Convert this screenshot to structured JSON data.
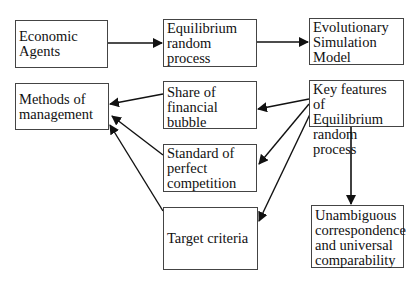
{
  "nodes": {
    "economic_agents": {
      "lines": [
        "Economic",
        "Agents"
      ]
    },
    "equilibrium_random_process": {
      "lines": [
        "Equilibrium",
        "random process"
      ]
    },
    "evolutionary_simulation_model": {
      "lines": [
        "Evolutionary",
        "Simulation",
        "Model"
      ]
    },
    "methods_of_management": {
      "line1a": "Methods",
      "line1b": "of",
      "line2": "management"
    },
    "share_of_financial_bubble": {
      "line1a": "Share",
      "line1b": "of",
      "line2": "financial bubble"
    },
    "key_features": {
      "line1a": "Key",
      "line1b": "features",
      "line1c": "of",
      "line2": "Equilibrium",
      "line3": "random process"
    },
    "standard_of_perfect_competition": {
      "line1a": "Standard",
      "line1b": "of",
      "line2": "perfect",
      "line3": "competition"
    },
    "target_criteria": {
      "lines": [
        "Target criteria"
      ]
    },
    "unambiguous_correspondence": {
      "line1": "Unambiguous",
      "line2": "correspondence",
      "line3a": "and",
      "line3b": "universal",
      "line4": "comparability"
    }
  },
  "edges": [
    {
      "from": "economic_agents",
      "to": "equilibrium_random_process"
    },
    {
      "from": "equilibrium_random_process",
      "to": "evolutionary_simulation_model"
    },
    {
      "from": "key_features",
      "to": "share_of_financial_bubble"
    },
    {
      "from": "key_features",
      "to": "standard_of_perfect_competition"
    },
    {
      "from": "key_features",
      "to": "target_criteria"
    },
    {
      "from": "key_features",
      "to": "unambiguous_correspondence"
    },
    {
      "from": "share_of_financial_bubble",
      "to": "methods_of_management"
    },
    {
      "from": "standard_of_perfect_competition",
      "to": "methods_of_management"
    },
    {
      "from": "target_criteria",
      "to": "methods_of_management"
    }
  ],
  "colors": {
    "stroke": "#111111",
    "border": "#444444",
    "background": "#ffffff"
  }
}
